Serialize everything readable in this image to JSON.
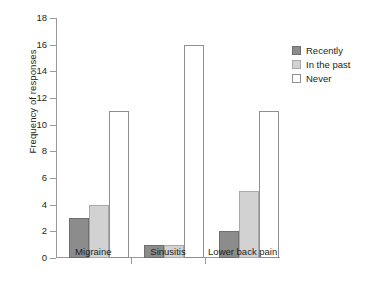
{
  "chart_data": {
    "type": "bar",
    "title": "",
    "subtitle": "",
    "xlabel": "",
    "ylabel": "Frequency of responses",
    "categories": [
      "Migraine",
      "Sinusitis",
      "Lower back pain"
    ],
    "series": [
      {
        "name": "Recently",
        "color": "#8c8c8c",
        "values": [
          3,
          1,
          2
        ]
      },
      {
        "name": "In the past",
        "color": "#d2d2d2",
        "values": [
          4,
          1,
          5
        ]
      },
      {
        "name": "Never",
        "color": "#ffffff",
        "values": [
          11,
          16,
          11
        ]
      }
    ],
    "ylim": [
      0,
      18
    ],
    "ytick_step": 2,
    "yticks": [
      0,
      2,
      4,
      6,
      8,
      10,
      12,
      14,
      16,
      18
    ],
    "ytick_labels": [
      "0",
      "2",
      "4",
      "6",
      "8",
      "10",
      "12",
      "14",
      "16",
      "18"
    ],
    "grid": false,
    "legend_position": "right",
    "axis_color": "#9a9a9a"
  }
}
